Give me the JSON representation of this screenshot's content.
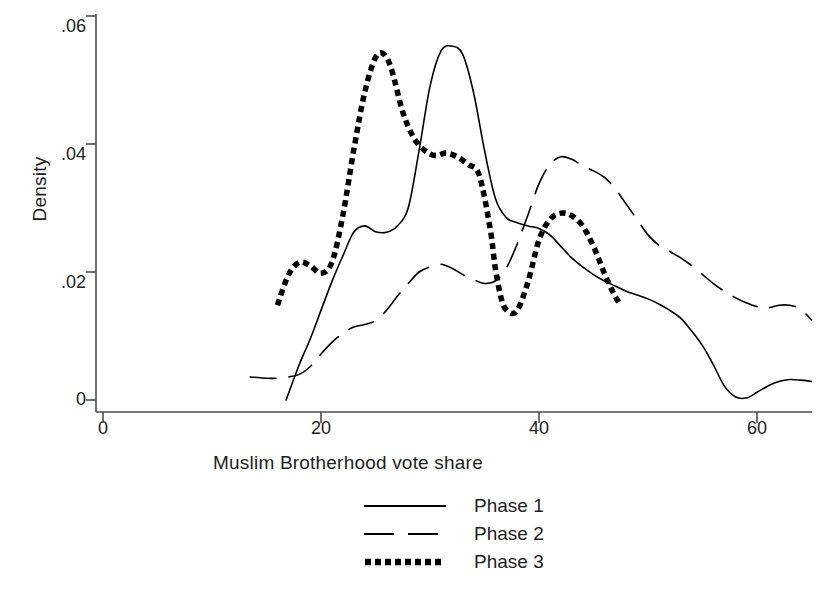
{
  "chart_data": {
    "type": "line",
    "title": "",
    "subtitle": "",
    "xlabel": "Muslim Brotherhood vote share",
    "ylabel": "Density",
    "xlim": [
      0,
      65
    ],
    "ylim": [
      0,
      0.062
    ],
    "xticks": [
      0,
      20,
      40,
      60
    ],
    "xticklabels": [
      "0",
      "20",
      "40",
      "60"
    ],
    "yticks": [
      0,
      0.02,
      0.04,
      0.06
    ],
    "yticklabels": [
      "0",
      ".02",
      ".04",
      ".06"
    ],
    "grid": false,
    "legend_position": "below-axes-center",
    "series": [
      {
        "name": "Phase 1",
        "linestyle": "solid",
        "color": "#000000",
        "linewidth": 1.6,
        "x": [
          16.8,
          18.0,
          19.0,
          20.0,
          21.0,
          22.0,
          23.0,
          24.0,
          25.0,
          26.0,
          27.0,
          28.0,
          29.0,
          30.0,
          31.0,
          32.0,
          33.0,
          34.0,
          35.0,
          36.0,
          37.0,
          38.0,
          39.0,
          40.0,
          41.0,
          42.0,
          43.0,
          44.0,
          45.0,
          46.0,
          47.0,
          48.0,
          49.0,
          50.0,
          51.0,
          52.0,
          53.0,
          54.0,
          55.0,
          56.0,
          57.0,
          58.0,
          59.0,
          60.0,
          61.0,
          62.0,
          63.0,
          64.0,
          65.0
        ],
        "y": [
          0.0,
          0.0055,
          0.0095,
          0.014,
          0.0185,
          0.0225,
          0.0262,
          0.0272,
          0.0263,
          0.0262,
          0.0272,
          0.03,
          0.039,
          0.049,
          0.0545,
          0.0553,
          0.054,
          0.048,
          0.039,
          0.0315,
          0.0285,
          0.0277,
          0.0272,
          0.0268,
          0.0258,
          0.024,
          0.0222,
          0.0208,
          0.0196,
          0.0186,
          0.0178,
          0.017,
          0.0164,
          0.0158,
          0.015,
          0.014,
          0.0128,
          0.0108,
          0.0085,
          0.0055,
          0.0022,
          0.0005,
          0.0003,
          0.0012,
          0.0022,
          0.0029,
          0.0032,
          0.0031,
          0.0029
        ]
      },
      {
        "name": "Phase 2",
        "linestyle": "dashed",
        "color": "#000000",
        "linewidth": 1.6,
        "x": [
          13.5,
          15.0,
          16.0,
          17.0,
          18.0,
          19.0,
          20.0,
          21.0,
          22.0,
          23.0,
          24.0,
          25.0,
          26.0,
          27.0,
          28.0,
          29.0,
          30.0,
          31.0,
          32.0,
          33.0,
          34.0,
          35.0,
          36.0,
          37.0,
          38.0,
          39.0,
          40.0,
          41.0,
          42.0,
          43.0,
          44.0,
          45.0,
          46.0,
          47.0,
          48.0,
          49.0,
          50.0,
          51.0,
          52.0,
          53.0,
          54.0,
          55.0,
          56.0,
          57.0,
          58.0,
          59.0,
          60.0,
          61.0,
          62.0,
          63.0,
          64.0,
          65.0
        ],
        "y": [
          0.0036,
          0.0034,
          0.0034,
          0.0036,
          0.004,
          0.0052,
          0.0072,
          0.009,
          0.0104,
          0.0114,
          0.0118,
          0.0124,
          0.014,
          0.0162,
          0.0182,
          0.02,
          0.0208,
          0.0212,
          0.0206,
          0.0196,
          0.0188,
          0.0182,
          0.0186,
          0.0206,
          0.0244,
          0.029,
          0.0338,
          0.0368,
          0.038,
          0.0376,
          0.0366,
          0.0358,
          0.0348,
          0.033,
          0.0306,
          0.0282,
          0.0258,
          0.0242,
          0.0232,
          0.0222,
          0.021,
          0.0196,
          0.0182,
          0.017,
          0.016,
          0.0152,
          0.0146,
          0.0144,
          0.0148,
          0.0148,
          0.0142,
          0.0125
        ]
      },
      {
        "name": "Phase 3",
        "linestyle": "dotted",
        "color": "#000000",
        "linewidth": 5.5,
        "x": [
          16.0,
          17.0,
          18.0,
          19.0,
          20.0,
          21.0,
          22.0,
          23.0,
          24.0,
          25.0,
          25.8,
          26.5,
          27.5,
          28.5,
          29.5,
          30.5,
          31.5,
          32.5,
          33.5,
          34.5,
          35.5,
          36.0,
          36.6,
          37.2,
          38.0,
          39.0,
          40.0,
          41.0,
          42.0,
          43.0,
          44.0,
          45.0,
          46.0,
          46.8,
          47.4
        ],
        "y": [
          0.0148,
          0.0195,
          0.0215,
          0.021,
          0.0198,
          0.0215,
          0.0288,
          0.039,
          0.048,
          0.0535,
          0.054,
          0.0515,
          0.045,
          0.041,
          0.039,
          0.0382,
          0.0386,
          0.038,
          0.0368,
          0.0352,
          0.027,
          0.0205,
          0.0155,
          0.0138,
          0.014,
          0.0185,
          0.025,
          0.0282,
          0.0292,
          0.0288,
          0.0272,
          0.024,
          0.0198,
          0.0168,
          0.015
        ]
      }
    ]
  },
  "legend": {
    "items": [
      {
        "label": "Phase 1",
        "style": "solid"
      },
      {
        "label": "Phase 2",
        "style": "dashed"
      },
      {
        "label": "Phase 3",
        "style": "dotted"
      }
    ]
  },
  "axes": {
    "y_title": "Density",
    "x_title": "Muslim Brotherhood vote share"
  }
}
